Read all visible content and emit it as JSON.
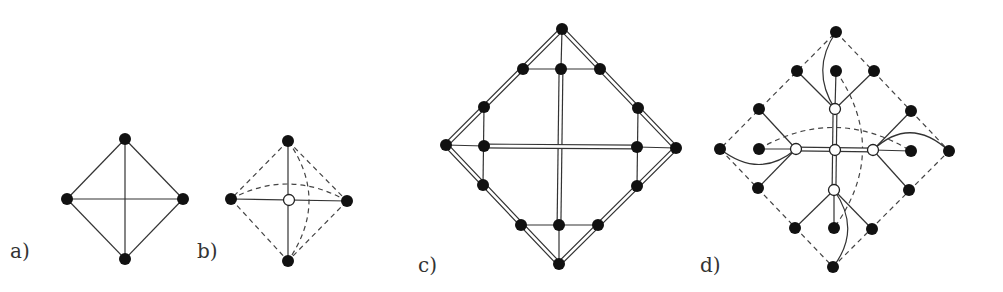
{
  "figure": {
    "panels": [
      {
        "id": "a",
        "label": "a)"
      },
      {
        "id": "b",
        "label": "b)"
      },
      {
        "id": "c",
        "label": "c)"
      },
      {
        "id": "d",
        "label": "d)"
      }
    ]
  },
  "colors": {
    "node_fill": "#111111",
    "edge": "#333333",
    "hollow_fill": "#ffffff",
    "background": "#ffffff"
  }
}
